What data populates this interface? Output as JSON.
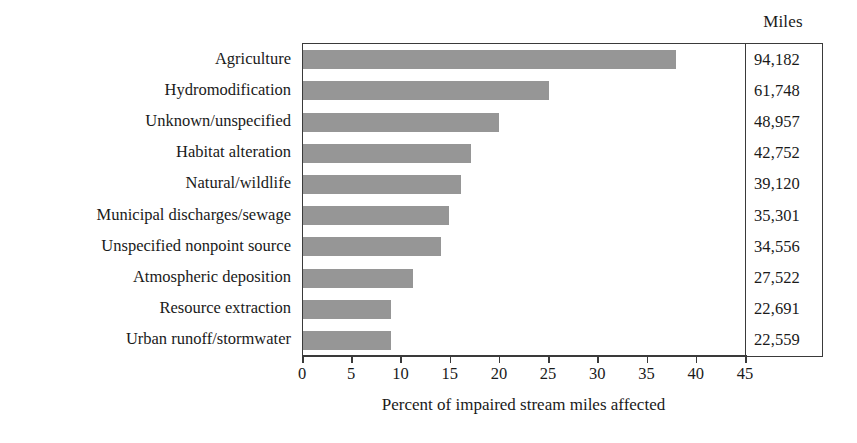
{
  "chart_data": {
    "type": "bar",
    "orientation": "horizontal",
    "title": "",
    "xlabel": "Percent of impaired stream miles affected",
    "ylabel": "",
    "xlim": [
      0,
      45
    ],
    "xticks": [
      0,
      5,
      10,
      15,
      20,
      25,
      30,
      35,
      40,
      45
    ],
    "xtick_labels": [
      "0",
      "5",
      "10",
      "15",
      "20",
      "25",
      "30",
      "35",
      "40",
      "45"
    ],
    "grid": false,
    "legend": null,
    "bar_color": "#969696",
    "axis_color": "#3a3a3a",
    "categories": [
      "Agriculture",
      "Hydromodification",
      "Unknown/unspecified",
      "Habitat alteration",
      "Natural/wildlife",
      "Municipal discharges/sewage",
      "Unspecified nonpoint source",
      "Atmospheric deposition",
      "Resource extraction",
      "Urban runoff/stormwater"
    ],
    "values": [
      37.9,
      25.0,
      19.9,
      17.1,
      16.1,
      14.8,
      14.0,
      11.2,
      8.9,
      8.9
    ],
    "annotation_column": {
      "header": "Miles",
      "values": [
        "94,182",
        "61,748",
        "48,957",
        "42,752",
        "39,120",
        "35,301",
        "34,556",
        "27,522",
        "22,691",
        "22,559"
      ]
    }
  }
}
